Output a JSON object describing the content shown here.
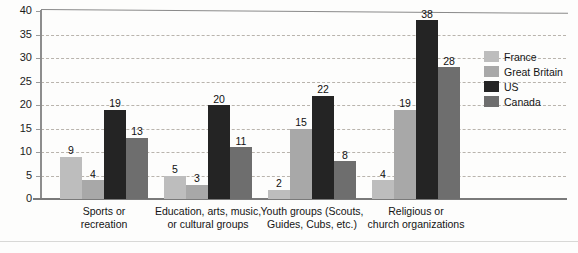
{
  "chart_data": {
    "type": "bar",
    "title": "",
    "subtitle": "",
    "xlabel": "",
    "ylabel": "",
    "ylim": [
      0,
      40
    ],
    "yticks": [
      0,
      5,
      10,
      15,
      20,
      25,
      30,
      35,
      40
    ],
    "grid": true,
    "legend_position": "right",
    "orientation": "vertical",
    "grouping": "clustered",
    "categories": [
      "Sports or\nrecreation",
      "Education, arts, music,\nor cultural groups",
      "Youth groups (Scouts,\nGuides, Cubs, etc.)",
      "Religious or\nchurch organizations"
    ],
    "series": [
      {
        "name": "France",
        "color": "#bdbdbd",
        "values": [
          9,
          5,
          2,
          4
        ]
      },
      {
        "name": "Great Britain",
        "color": "#a8a8a8",
        "values": [
          4,
          3,
          15,
          19
        ]
      },
      {
        "name": "US",
        "color": "#242424",
        "values": [
          19,
          20,
          22,
          38
        ]
      },
      {
        "name": "Canada",
        "color": "#6e6e6e",
        "values": [
          13,
          11,
          8,
          28
        ]
      }
    ]
  },
  "legend": {
    "items": [
      {
        "label": "France"
      },
      {
        "label": "Great Britain"
      },
      {
        "label": "US"
      },
      {
        "label": "Canada"
      }
    ]
  },
  "axis": {
    "y_tick_labels": [
      "40",
      "35",
      "30",
      "25",
      "20",
      "15",
      "10",
      "5",
      "0"
    ]
  },
  "caption_fragment": ""
}
